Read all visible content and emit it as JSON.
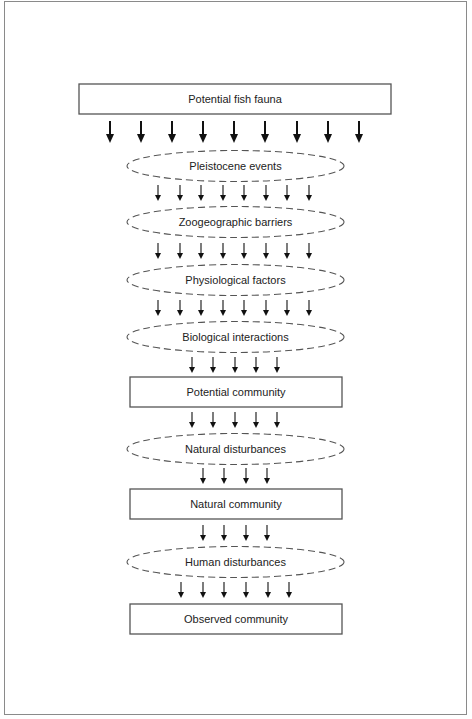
{
  "diagram": {
    "type": "flow-filter",
    "nodes": [
      {
        "id": "potential-fish-fauna",
        "shape": "box",
        "label": "Potential fish fauna",
        "x": 79,
        "y": 84,
        "w": 312,
        "h": 30
      },
      {
        "id": "pleistocene-events",
        "shape": "dashed-ellipse",
        "label": "Pleistocene events",
        "cx": 235.5,
        "cy": 166,
        "rx": 108.5,
        "ry": 15.5
      },
      {
        "id": "zoogeographic-barriers",
        "shape": "dashed-ellipse",
        "label": "Zoogeographic barriers",
        "cx": 235.5,
        "cy": 222,
        "rx": 108.5,
        "ry": 15.5
      },
      {
        "id": "physiological-factors",
        "shape": "dashed-ellipse",
        "label": "Physiological factors",
        "cx": 235.5,
        "cy": 280,
        "rx": 108.5,
        "ry": 15.5
      },
      {
        "id": "biological-interactions",
        "shape": "dashed-ellipse",
        "label": "Biological interactions",
        "cx": 235.5,
        "cy": 337,
        "rx": 108.5,
        "ry": 15.5
      },
      {
        "id": "potential-community",
        "shape": "box",
        "label": "Potential community",
        "x": 130,
        "y": 377,
        "w": 212,
        "h": 30
      },
      {
        "id": "natural-disturbances",
        "shape": "dashed-ellipse",
        "label": "Natural disturbances",
        "cx": 235.5,
        "cy": 449,
        "rx": 108.5,
        "ry": 15.5
      },
      {
        "id": "natural-community",
        "shape": "box",
        "label": "Natural community",
        "x": 130,
        "y": 489,
        "w": 212,
        "h": 30
      },
      {
        "id": "human-disturbances",
        "shape": "dashed-ellipse",
        "label": "Human disturbances",
        "cx": 235.5,
        "cy": 562,
        "rx": 108.5,
        "ry": 15.5
      },
      {
        "id": "observed-community",
        "shape": "box",
        "label": "Observed community",
        "x": 130,
        "y": 604,
        "w": 212,
        "h": 30
      }
    ],
    "arrow_rows": [
      {
        "count": 9,
        "xs": [
          110,
          141,
          172,
          203,
          234,
          265,
          297,
          328,
          359
        ],
        "y1": 121,
        "y2": 143,
        "heavy": true
      },
      {
        "count": 8,
        "xs": [
          158,
          180,
          201,
          223,
          244,
          266,
          287,
          309
        ],
        "y1": 185,
        "y2": 201,
        "heavy": false
      },
      {
        "count": 8,
        "xs": [
          158,
          180,
          201,
          223,
          244,
          266,
          287,
          309
        ],
        "y1": 243,
        "y2": 259,
        "heavy": false
      },
      {
        "count": 8,
        "xs": [
          158,
          180,
          201,
          223,
          244,
          266,
          287,
          309
        ],
        "y1": 300,
        "y2": 316,
        "heavy": false
      },
      {
        "count": 5,
        "xs": [
          192,
          213,
          235,
          256,
          277
        ],
        "y1": 357,
        "y2": 373,
        "heavy": false
      },
      {
        "count": 5,
        "xs": [
          192,
          213,
          235,
          256,
          277
        ],
        "y1": 412,
        "y2": 428,
        "heavy": false
      },
      {
        "count": 4,
        "xs": [
          203,
          224,
          246,
          267
        ],
        "y1": 468,
        "y2": 484,
        "heavy": false
      },
      {
        "count": 4,
        "xs": [
          203,
          224,
          246,
          267
        ],
        "y1": 525,
        "y2": 541,
        "heavy": false
      },
      {
        "count": 6,
        "xs": [
          181,
          203,
          224,
          246,
          268,
          289
        ],
        "y1": 582,
        "y2": 598,
        "heavy": false
      }
    ]
  },
  "labels": {
    "potential_fish_fauna": "Potential fish fauna",
    "pleistocene_events": "Pleistocene events",
    "zoogeographic_barriers": "Zoogeographic barriers",
    "physiological_factors": "Physiological factors",
    "biological_interactions": "Biological interactions",
    "potential_community": "Potential community",
    "natural_disturbances": "Natural disturbances",
    "natural_community": "Natural community",
    "human_disturbances": "Human disturbances",
    "observed_community": "Observed community"
  },
  "colors": {
    "line": "#555555",
    "arrow": "#111111",
    "frame": "#8a8a8a",
    "background": "#ffffff"
  }
}
